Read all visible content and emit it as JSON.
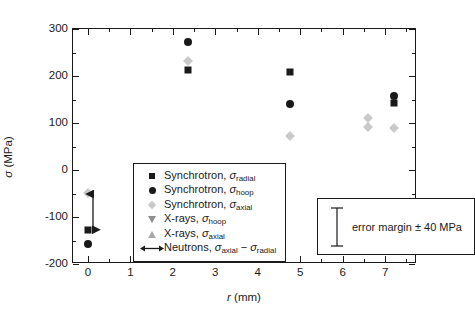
{
  "chart_data": {
    "type": "scatter",
    "title": "",
    "xlabel": "r (mm)",
    "ylabel": "σ (MPa)",
    "xlim": [
      -0.35,
      7.75
    ],
    "ylim": [
      -200,
      300
    ],
    "xticks": [
      0,
      1,
      2,
      3,
      4,
      5,
      6,
      7
    ],
    "xtick_labels": [
      "0",
      "1",
      "2",
      "3",
      "4",
      "5",
      "6",
      "7"
    ],
    "yticks": [
      -200,
      -100,
      0,
      100,
      200,
      300
    ],
    "ytick_labels": [
      "-200",
      "-100",
      "0",
      "100",
      "200",
      "300"
    ],
    "xminor_step": 0.5,
    "yminor_step": 50,
    "grid": false,
    "legend_position": "center-left",
    "series": [
      {
        "name": "Synchrotron, σ_radial",
        "marker": "square",
        "color": "#1a1a1a",
        "points": [
          {
            "x": 0.0,
            "y": -127
          },
          {
            "x": 2.35,
            "y": 212
          },
          {
            "x": 4.75,
            "y": 208
          },
          {
            "x": 7.2,
            "y": 143
          }
        ]
      },
      {
        "name": "Synchrotron, σ_hoop",
        "marker": "circle",
        "color": "#1a1a1a",
        "points": [
          {
            "x": 0.0,
            "y": -158
          },
          {
            "x": 2.35,
            "y": 272
          },
          {
            "x": 4.75,
            "y": 140
          },
          {
            "x": 7.2,
            "y": 157
          }
        ]
      },
      {
        "name": "Synchrotron, σ_axial",
        "marker": "diamond",
        "color": "#c9c9c9",
        "points": [
          {
            "x": 0.0,
            "y": -48
          },
          {
            "x": 2.35,
            "y": 232
          },
          {
            "x": 4.75,
            "y": 73
          },
          {
            "x": 6.6,
            "y": 110
          },
          {
            "x": 6.6,
            "y": 92
          },
          {
            "x": 7.2,
            "y": 90
          }
        ]
      },
      {
        "name": "X-rays, σ_hoop",
        "marker": "triangle-down",
        "color": "#8f8f8f",
        "points": [
          {
            "x": 7.65,
            "y": -130
          }
        ]
      },
      {
        "name": "X-rays, σ_axial",
        "marker": "triangle-up",
        "color": "#a8a8a8",
        "points": [
          {
            "x": 7.65,
            "y": -90
          }
        ]
      },
      {
        "name": "Neutrons, σ_axial − σ_radial",
        "marker": "double-arrow",
        "color": "#1a1a1a",
        "points": [
          {
            "x": 0.12,
            "y_from": -128,
            "y_to": -52
          }
        ]
      }
    ],
    "annotations": [
      {
        "text": "error margin ± 40 MPa",
        "bar_span_mpa": 40
      }
    ]
  },
  "axes": {
    "y_title_sigma": "σ",
    "y_title_unit": "(MPa)",
    "x_title_r": "r",
    "x_title_unit": "(mm)"
  },
  "legend": {
    "items": [
      {
        "marker": "square",
        "prefix": "Synchrotron, ",
        "sigma": "σ",
        "sub": "radial",
        "suffix": ""
      },
      {
        "marker": "circle",
        "prefix": "Synchrotron, ",
        "sigma": "σ",
        "sub": "hoop",
        "suffix": ""
      },
      {
        "marker": "diamond",
        "prefix": "Synchrotron, ",
        "sigma": "σ",
        "sub": "axial",
        "suffix": ""
      },
      {
        "marker": "triangle-down",
        "prefix": "X-rays, ",
        "sigma": "σ",
        "sub": "hoop",
        "suffix": ""
      },
      {
        "marker": "triangle-up",
        "prefix": "X-rays, ",
        "sigma": "σ",
        "sub": "axial",
        "suffix": ""
      },
      {
        "marker": "double-arrow",
        "prefix": "Neutrons, ",
        "sigma": "σ",
        "sub": "axial",
        "suffix": " − ",
        "sigma2": "σ",
        "sub2": "radial"
      }
    ]
  },
  "error_box": {
    "label": "error margin ± 40 MPa"
  }
}
